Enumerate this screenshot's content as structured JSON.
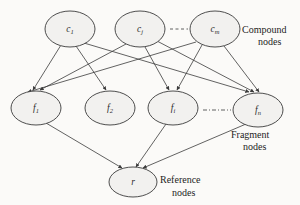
{
  "diagram": {
    "background_color": "#fbfaf8",
    "node_fill_color": "#f2f1ef",
    "stroke_color": "#3b3b3b",
    "layers": [
      {
        "id": "compound",
        "label_line1": "Compound",
        "label_line2": "nodes",
        "nodes": [
          {
            "id": "c1",
            "base": "c",
            "sub": "1",
            "cx": 70,
            "cy": 29,
            "rx": 25,
            "ry": 18
          },
          {
            "id": "cj",
            "base": "c",
            "sub": "j",
            "cx": 140,
            "cy": 29,
            "rx": 25,
            "ry": 18
          },
          {
            "id": "cm",
            "base": "c",
            "sub": "m",
            "cx": 215,
            "cy": 29,
            "rx": 25,
            "ry": 18
          }
        ],
        "ellipsis": {
          "x1": 170,
          "x2": 188,
          "y": 29
        }
      },
      {
        "id": "fragment",
        "label_line1": "Fragment",
        "label_line2": "nodes",
        "nodes": [
          {
            "id": "f1",
            "base": "f",
            "sub": "1",
            "cx": 36,
            "cy": 108,
            "rx": 25,
            "ry": 17
          },
          {
            "id": "f2",
            "base": "f",
            "sub": "2",
            "cx": 110,
            "cy": 108,
            "rx": 25,
            "ry": 17
          },
          {
            "id": "fi",
            "base": "f",
            "sub": "i",
            "cx": 173,
            "cy": 108,
            "rx": 25,
            "ry": 17
          },
          {
            "id": "fn",
            "base": "f",
            "sub": "n",
            "cx": 258,
            "cy": 110,
            "rx": 25,
            "ry": 17
          }
        ],
        "ellipsis": {
          "x1": 203,
          "x2": 230,
          "y": 110
        }
      },
      {
        "id": "reference",
        "label_line1": "Reference",
        "label_line2": "nodes",
        "nodes": [
          {
            "id": "r",
            "base": "r",
            "sub": "",
            "cx": 133,
            "cy": 182,
            "rx": 24,
            "ry": 15
          }
        ]
      }
    ],
    "edges": [
      {
        "from": "c1",
        "to": "f1"
      },
      {
        "from": "c1",
        "to": "f2"
      },
      {
        "from": "c1",
        "to": "fn"
      },
      {
        "from": "cj",
        "to": "f1"
      },
      {
        "from": "cj",
        "to": "fi"
      },
      {
        "from": "cj",
        "to": "fn"
      },
      {
        "from": "cm",
        "to": "f1"
      },
      {
        "from": "cm",
        "to": "fi"
      },
      {
        "from": "cm",
        "to": "fn"
      },
      {
        "from": "f1",
        "to": "r"
      },
      {
        "from": "fi",
        "to": "r"
      },
      {
        "from": "fn",
        "to": "r"
      }
    ],
    "labels": {
      "compound_line1": "Compound",
      "compound_line2": "nodes",
      "fragment_line1": "Fragment",
      "fragment_line2": "nodes",
      "reference_line1": "Reference",
      "reference_line2": "nodes"
    }
  }
}
